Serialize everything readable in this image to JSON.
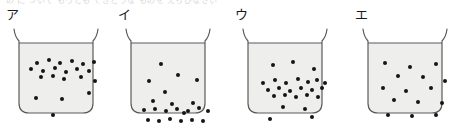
{
  "page": {
    "cut_off_top_text": "の に ついて  もっとも てきとうな ものを  えらびなさい",
    "figure_caption": ""
  },
  "colors": {
    "ink": "#1a1a1a",
    "particle": "#151515",
    "glass_outline": "#5b5b5b",
    "liquid_fill": "#eeeeec",
    "background": "#ffffff"
  },
  "beakers": [
    {
      "label": "ア",
      "name": "beaker-a",
      "distribution": "concentrated-near-top",
      "particle_count": 21,
      "particles": [
        {
          "x": 18,
          "y": 20
        },
        {
          "x": 30,
          "y": 17
        },
        {
          "x": 41,
          "y": 20
        },
        {
          "x": 53,
          "y": 18
        },
        {
          "x": 64,
          "y": 21
        },
        {
          "x": 75,
          "y": 19
        },
        {
          "x": 12,
          "y": 26
        },
        {
          "x": 24,
          "y": 28
        },
        {
          "x": 36,
          "y": 25
        },
        {
          "x": 47,
          "y": 29
        },
        {
          "x": 58,
          "y": 26
        },
        {
          "x": 70,
          "y": 28
        },
        {
          "x": 22,
          "y": 34
        },
        {
          "x": 34,
          "y": 33
        },
        {
          "x": 45,
          "y": 36
        },
        {
          "x": 62,
          "y": 34
        },
        {
          "x": 76,
          "y": 38
        },
        {
          "x": 17,
          "y": 55
        },
        {
          "x": 43,
          "y": 56
        },
        {
          "x": 70,
          "y": 50
        },
        {
          "x": 34,
          "y": 72
        }
      ]
    },
    {
      "label": "イ",
      "name": "beaker-b",
      "distribution": "concentrated-near-bottom",
      "particle_count": 22,
      "particles": [
        {
          "x": 30,
          "y": 21
        },
        {
          "x": 47,
          "y": 32
        },
        {
          "x": 18,
          "y": 38
        },
        {
          "x": 66,
          "y": 37
        },
        {
          "x": 34,
          "y": 49
        },
        {
          "x": 22,
          "y": 58
        },
        {
          "x": 13,
          "y": 67
        },
        {
          "x": 24,
          "y": 66
        },
        {
          "x": 35,
          "y": 68
        },
        {
          "x": 46,
          "y": 66
        },
        {
          "x": 57,
          "y": 68
        },
        {
          "x": 68,
          "y": 65
        },
        {
          "x": 77,
          "y": 68
        },
        {
          "x": 41,
          "y": 61
        },
        {
          "x": 62,
          "y": 60
        },
        {
          "x": 17,
          "y": 77
        },
        {
          "x": 28,
          "y": 78
        },
        {
          "x": 39,
          "y": 76
        },
        {
          "x": 50,
          "y": 78
        },
        {
          "x": 61,
          "y": 77
        },
        {
          "x": 72,
          "y": 78
        },
        {
          "x": 53,
          "y": 70
        }
      ]
    },
    {
      "label": "ウ",
      "name": "beaker-c",
      "distribution": "concentrated-in-middle",
      "particle_count": 25,
      "particles": [
        {
          "x": 25,
          "y": 22
        },
        {
          "x": 45,
          "y": 19
        },
        {
          "x": 66,
          "y": 26
        },
        {
          "x": 15,
          "y": 40
        },
        {
          "x": 27,
          "y": 37
        },
        {
          "x": 38,
          "y": 40
        },
        {
          "x": 50,
          "y": 36
        },
        {
          "x": 60,
          "y": 39
        },
        {
          "x": 69,
          "y": 37
        },
        {
          "x": 77,
          "y": 40
        },
        {
          "x": 20,
          "y": 47
        },
        {
          "x": 31,
          "y": 45
        },
        {
          "x": 42,
          "y": 48
        },
        {
          "x": 53,
          "y": 45
        },
        {
          "x": 64,
          "y": 47
        },
        {
          "x": 74,
          "y": 45
        },
        {
          "x": 26,
          "y": 53
        },
        {
          "x": 37,
          "y": 52
        },
        {
          "x": 48,
          "y": 54
        },
        {
          "x": 59,
          "y": 52
        },
        {
          "x": 70,
          "y": 54
        },
        {
          "x": 35,
          "y": 64
        },
        {
          "x": 57,
          "y": 66
        },
        {
          "x": 22,
          "y": 76
        },
        {
          "x": 64,
          "y": 74
        }
      ]
    },
    {
      "label": "エ",
      "name": "beaker-d",
      "distribution": "evenly-distributed",
      "particle_count": 15,
      "particles": [
        {
          "x": 17,
          "y": 20
        },
        {
          "x": 42,
          "y": 24
        },
        {
          "x": 68,
          "y": 21
        },
        {
          "x": 30,
          "y": 33
        },
        {
          "x": 55,
          "y": 34
        },
        {
          "x": 77,
          "y": 38
        },
        {
          "x": 15,
          "y": 45
        },
        {
          "x": 38,
          "y": 48
        },
        {
          "x": 63,
          "y": 45
        },
        {
          "x": 26,
          "y": 57
        },
        {
          "x": 50,
          "y": 59
        },
        {
          "x": 74,
          "y": 60
        },
        {
          "x": 20,
          "y": 72
        },
        {
          "x": 44,
          "y": 73
        },
        {
          "x": 68,
          "y": 72
        }
      ]
    }
  ]
}
